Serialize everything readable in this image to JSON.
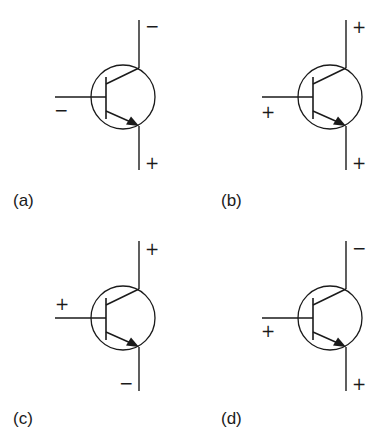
{
  "figure": {
    "colors": {
      "ink": "#1a1a1a",
      "background": "#ffffff"
    },
    "panels": [
      {
        "id": "a",
        "label": "(a)",
        "collector_sign": "−",
        "base_sign": "−",
        "emitter_sign": "+"
      },
      {
        "id": "b",
        "label": "(b)",
        "collector_sign": "+",
        "base_sign": "+",
        "emitter_sign": "+"
      },
      {
        "id": "c",
        "label": "(c)",
        "collector_sign": "+",
        "base_sign": "+",
        "emitter_sign": "−"
      },
      {
        "id": "d",
        "label": "(d)",
        "collector_sign": "−",
        "base_sign": "+",
        "emitter_sign": "+"
      }
    ]
  }
}
